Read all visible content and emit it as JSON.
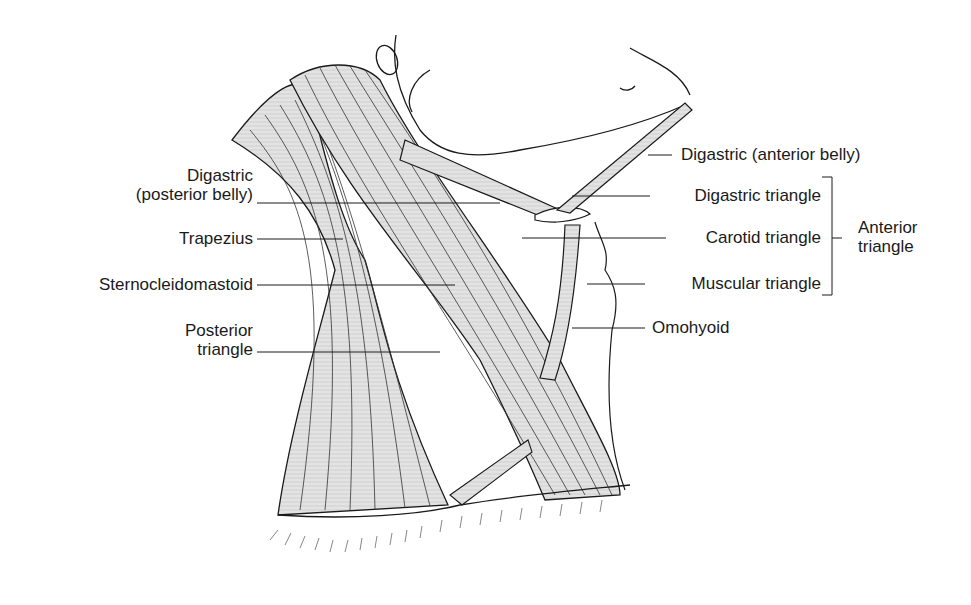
{
  "diagram": {
    "labels_left": [
      {
        "id": "digastric-posterior",
        "lines": [
          "Digastric",
          "(posterior belly)"
        ]
      },
      {
        "id": "trapezius",
        "lines": [
          "Trapezius"
        ]
      },
      {
        "id": "sternocleidomastoid",
        "lines": [
          "Sternocleidomastoid"
        ]
      },
      {
        "id": "posterior-triangle",
        "lines": [
          "Posterior",
          "triangle"
        ]
      }
    ],
    "labels_right": [
      {
        "id": "digastric-anterior",
        "lines": [
          "Digastric (anterior belly)"
        ]
      },
      {
        "id": "digastric-triangle",
        "lines": [
          "Digastric triangle"
        ]
      },
      {
        "id": "carotid-triangle",
        "lines": [
          "Carotid triangle"
        ]
      },
      {
        "id": "muscular-triangle",
        "lines": [
          "Muscular triangle"
        ]
      },
      {
        "id": "omohyoid",
        "lines": [
          "Omohyoid"
        ]
      }
    ],
    "group_label": {
      "id": "anterior-triangle",
      "lines": [
        "Anterior",
        "triangle"
      ]
    },
    "colors": {
      "muscle_fill": "#d9d9d9",
      "line": "#1a1a1a",
      "background": "#ffffff"
    }
  }
}
